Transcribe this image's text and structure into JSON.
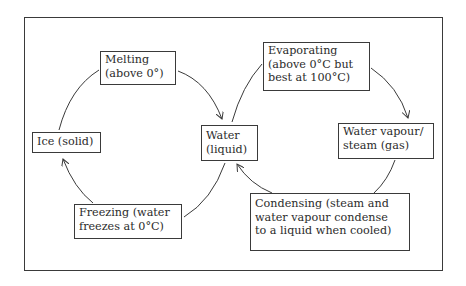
{
  "diagram": {
    "colors": {
      "stroke": "#3a3a3a",
      "text": "#2b2b2b",
      "background": "#ffffff"
    },
    "nodes": {
      "melting": {
        "lines": [
          "Melting",
          "(above 0°)"
        ]
      },
      "ice": {
        "lines": [
          "Ice (solid)"
        ]
      },
      "water": {
        "lines": [
          "Water",
          "(liquid)"
        ]
      },
      "freezing": {
        "lines": [
          "Freezing (water",
          "freezes at 0°C)"
        ]
      },
      "evaporating": {
        "lines": [
          "Evaporating",
          "(above 0°C but",
          "best at 100°C)"
        ]
      },
      "vapour": {
        "lines": [
          "Water vapour/",
          "steam (gas)"
        ]
      },
      "condensing": {
        "lines": [
          "Condensing (steam and",
          "water vapour condense",
          "to a liquid when cooled)"
        ]
      }
    },
    "edges": [
      {
        "from": "ice",
        "to": "melting",
        "arrowhead": false
      },
      {
        "from": "melting",
        "to": "water",
        "arrowhead": true
      },
      {
        "from": "water",
        "to": "evaporating",
        "arrowhead": false
      },
      {
        "from": "evaporating",
        "to": "vapour",
        "arrowhead": true
      },
      {
        "from": "vapour",
        "to": "condensing",
        "arrowhead": false
      },
      {
        "from": "condensing",
        "to": "water",
        "arrowhead": true
      },
      {
        "from": "water",
        "to": "freezing",
        "arrowhead": false
      },
      {
        "from": "freezing",
        "to": "ice",
        "arrowhead": true
      }
    ]
  }
}
